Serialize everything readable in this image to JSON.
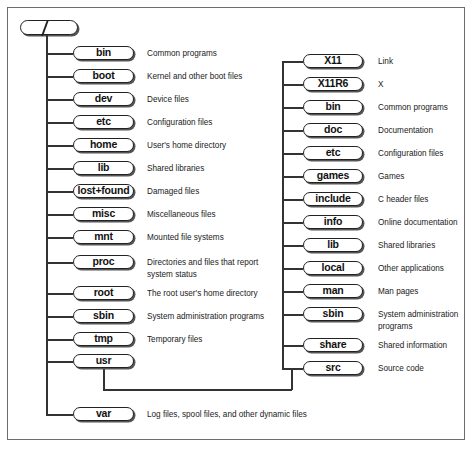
{
  "root": {
    "label": "/"
  },
  "left": [
    {
      "name": "bin",
      "desc": "Common programs",
      "y": 53
    },
    {
      "name": "boot",
      "desc": "Kernel and other boot files",
      "y": 76
    },
    {
      "name": "dev",
      "desc": "Device files",
      "y": 99
    },
    {
      "name": "etc",
      "desc": "Configuration files",
      "y": 122
    },
    {
      "name": "home",
      "desc": "User's home directory",
      "y": 145
    },
    {
      "name": "lib",
      "desc": "Shared libraries",
      "y": 168
    },
    {
      "name": "lost+found",
      "desc": "Damaged files",
      "y": 191
    },
    {
      "name": "misc",
      "desc": "Miscellaneous files",
      "y": 214
    },
    {
      "name": "mnt",
      "desc": "Mounted file systems",
      "y": 237
    },
    {
      "name": "proc",
      "desc": "Directories and files that report",
      "desc2": "system status",
      "y": 262
    },
    {
      "name": "root",
      "desc": "The root user's home directory",
      "y": 293
    },
    {
      "name": "sbin",
      "desc": "System administration programs",
      "y": 316
    },
    {
      "name": "tmp",
      "desc": "Temporary files",
      "y": 339
    },
    {
      "name": "usr",
      "desc": "",
      "y": 361
    },
    {
      "name": "var",
      "desc": "Log files, spool files, and other dynamic files",
      "y": 414
    }
  ],
  "right": [
    {
      "name": "X11",
      "desc": "Link",
      "y": 61
    },
    {
      "name": "X11R6",
      "desc": "X",
      "y": 84
    },
    {
      "name": "bin",
      "desc": "Common programs",
      "y": 107
    },
    {
      "name": "doc",
      "desc": "Documentation",
      "y": 130
    },
    {
      "name": "etc",
      "desc": "Configuration files",
      "y": 153
    },
    {
      "name": "games",
      "desc": "Games",
      "y": 176
    },
    {
      "name": "include",
      "desc": "C header files",
      "y": 199
    },
    {
      "name": "info",
      "desc": "Online documentation",
      "y": 222
    },
    {
      "name": "lib",
      "desc": "Shared libraries",
      "y": 245
    },
    {
      "name": "local",
      "desc": "Other applications",
      "y": 268
    },
    {
      "name": "man",
      "desc": "Man pages",
      "y": 291
    },
    {
      "name": "sbin",
      "desc": "System administration",
      "desc2": "programs",
      "y": 314
    },
    {
      "name": "share",
      "desc": "Shared information",
      "y": 345
    },
    {
      "name": "src",
      "desc": "Source code",
      "y": 368
    }
  ],
  "colors": {
    "line": "#333333",
    "frame": "#6d6d6d",
    "pill_border": "#222222",
    "shadow": "#555555"
  }
}
